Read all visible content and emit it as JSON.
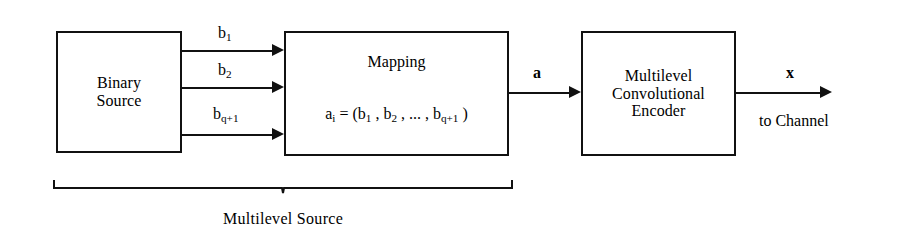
{
  "figure": {
    "type": "block-diagram"
  },
  "blocks": {
    "binary_source": {
      "line1": "Binary",
      "line2": "Source"
    },
    "mapping": {
      "title": "Mapping",
      "equation_parts": {
        "a": "a",
        "a_sub": "i",
        "equals": " = (b",
        "b1_sub": "1",
        "sep1": " , b",
        "b2_sub": "2",
        "sep2": " , ... , b",
        "bq_sub": "q+1",
        "close": " )"
      },
      "equation_plain": "a i = (b 1 , b 2 , ... , b q+1 )"
    },
    "encoder": {
      "line1": "Multilevel",
      "line2": "Convolutional",
      "line3": "Encoder"
    }
  },
  "signals": {
    "b1": {
      "base": "b",
      "sub": "1"
    },
    "b2": {
      "base": "b",
      "sub": "2"
    },
    "bq1": {
      "base": "b",
      "sub": "q+1"
    },
    "a": "a",
    "x": "x"
  },
  "captions": {
    "multilevel_source": "Multilevel Source",
    "to_channel": "to Channel"
  },
  "colors": {
    "stroke": "#111111",
    "background": "#ffffff",
    "text": "#000000"
  }
}
